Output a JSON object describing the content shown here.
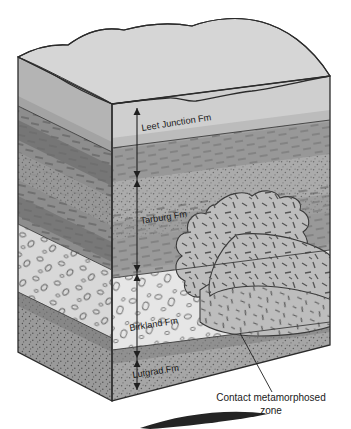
{
  "figure": {
    "type": "geologic-block-diagram",
    "title": "",
    "formations": [
      {
        "id": "leet-junction",
        "label": "Leet Junction Fm",
        "order": 1,
        "rock": "massive sandstone, light gray",
        "label_x": 142,
        "label_y": 131,
        "label_rotate": -9
      },
      {
        "id": "tarburg",
        "label": "Tarburg Fm",
        "order": 2,
        "rock": "interbedded shale and siltstone, medium gray",
        "label_x": 141,
        "label_y": 224,
        "label_rotate": -9
      },
      {
        "id": "birkland",
        "label": "Birkland Fm",
        "order": 3,
        "rock": "conglomerate with clasts, light",
        "label_x": 130,
        "label_y": 331,
        "label_rotate": -9
      },
      {
        "id": "lutgrad",
        "label": "Lutgrad Fm",
        "order": 4,
        "rock": "stippled sandstone, dark gray",
        "label_x": 133,
        "label_y": 378,
        "label_rotate": -9
      }
    ],
    "annotations": [
      {
        "id": "contact-metamorphosed-zone",
        "line1": "Contact metamorphosed",
        "line2": "zone",
        "x": 271,
        "y1": 401,
        "y2": 414
      }
    ],
    "dimension_line": {
      "x": 137,
      "ticks": [
        108,
        178,
        272,
        358,
        390
      ],
      "style": "double-headed-arrows"
    },
    "colors": {
      "top_surface": "#d2d2d2",
      "top_surface_shade": "#bfbfbf",
      "leet_front": "#cfcfcf",
      "leet_side": "#b4b4b4",
      "tarburg_front": "#9e9e9e",
      "tarburg_side": "#8a8a8a",
      "tarburg_band_dark": "#7d7d7d",
      "birkland_front": "#e4e4e4",
      "birkland_side": "#cdcdcd",
      "lutgrad_front": "#a6a6a6",
      "lutgrad_side": "#8f8f8f",
      "intrusion_fill": "#b9b9b9",
      "outline": "#2b2b2b",
      "text": "#1a1a1a"
    }
  }
}
